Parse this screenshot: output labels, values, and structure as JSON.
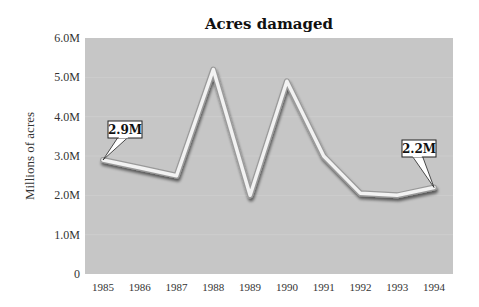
{
  "chart_data": {
    "type": "line",
    "title": "Acres damaged",
    "xlabel": "",
    "ylabel": "Millions of acres",
    "categories": [
      "1985",
      "1986",
      "1987",
      "1988",
      "1989",
      "1990",
      "1991",
      "1992",
      "1993",
      "1994"
    ],
    "series": [
      {
        "name": "Acres damaged",
        "values": [
          2.9,
          2.7,
          2.5,
          5.2,
          2.0,
          4.9,
          3.0,
          2.05,
          2.0,
          2.2
        ]
      }
    ],
    "ylim": [
      0,
      6.0
    ],
    "yticks": [
      0,
      1.0,
      2.0,
      3.0,
      4.0,
      5.0,
      6.0
    ],
    "ytick_labels": [
      "0",
      "1.0M",
      "2.0M",
      "3.0M",
      "4.0M",
      "5.0M",
      "6.0M"
    ],
    "grid": true,
    "legend": "none",
    "annotations": [
      {
        "category": "1985",
        "value": 2.9,
        "text": "2.9M"
      },
      {
        "category": "1994",
        "value": 2.2,
        "text": "2.2M"
      }
    ],
    "colors": {
      "plot_background": "#c6c6c6",
      "line": "#f2f2f2",
      "line_shadow": "#8a8a8a",
      "callout_fill": "#ffffff"
    }
  }
}
